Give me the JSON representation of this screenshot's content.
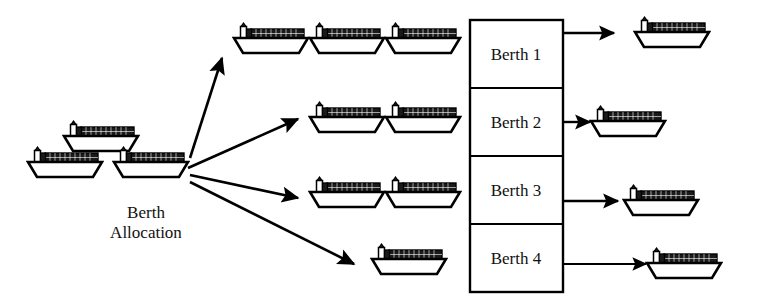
{
  "diagram": {
    "title": "Berth Allocation",
    "process_label_line1": "Berth",
    "process_label_line2": "Allocation",
    "colors": {
      "stroke": "#000000",
      "background": "#ffffff",
      "cargo_fill": "#1a1a1a",
      "hull_fill": "#ffffff"
    },
    "input_ships": [
      {
        "id": "input-ship-1",
        "x": 62,
        "y": 120
      },
      {
        "id": "input-ship-2",
        "x": 26,
        "y": 146
      },
      {
        "id": "input-ship-3",
        "x": 112,
        "y": 146
      }
    ],
    "queue_rows": [
      {
        "id": "queue-row-1",
        "berth": "Berth 1",
        "ships": [
          {
            "id": "queue-ship-1-1",
            "x": 232,
            "y": 22
          },
          {
            "id": "queue-ship-1-2",
            "x": 308,
            "y": 22
          },
          {
            "id": "queue-ship-1-3",
            "x": 384,
            "y": 22
          }
        ]
      },
      {
        "id": "queue-row-2",
        "berth": "Berth 2",
        "ships": [
          {
            "id": "queue-ship-2-1",
            "x": 308,
            "y": 101
          },
          {
            "id": "queue-ship-2-2",
            "x": 384,
            "y": 101
          }
        ]
      },
      {
        "id": "queue-row-3",
        "berth": "Berth 3",
        "ships": [
          {
            "id": "queue-ship-3-1",
            "x": 308,
            "y": 176
          },
          {
            "id": "queue-ship-3-2",
            "x": 384,
            "y": 176
          }
        ]
      },
      {
        "id": "queue-row-4",
        "berth": "Berth 4",
        "ships": [
          {
            "id": "queue-ship-4-1",
            "x": 370,
            "y": 243
          }
        ]
      }
    ],
    "allocation_arrows": [
      {
        "id": "allocation-arrow-1",
        "x1": 190,
        "y1": 158,
        "x2": 224,
        "y2": 57
      },
      {
        "id": "allocation-arrow-2",
        "x1": 188,
        "y1": 168,
        "x2": 300,
        "y2": 118
      },
      {
        "id": "allocation-arrow-3",
        "x1": 190,
        "y1": 175,
        "x2": 300,
        "y2": 199
      },
      {
        "id": "allocation-arrow-4",
        "x1": 190,
        "y1": 182,
        "x2": 356,
        "y2": 265
      }
    ],
    "berth_table": {
      "x": 470,
      "y": 20,
      "width": 93,
      "height": 272,
      "rows": [
        {
          "id": "berth-row-1",
          "label": "Berth 1"
        },
        {
          "id": "berth-row-2",
          "label": "Berth 2"
        },
        {
          "id": "berth-row-3",
          "label": "Berth 3"
        },
        {
          "id": "berth-row-4",
          "label": "Berth 4"
        }
      ]
    },
    "departure_arrows": [
      {
        "id": "departure-arrow-1",
        "x1": 563,
        "y1": 33,
        "x2": 616,
        "y2": 33
      },
      {
        "id": "departure-arrow-2",
        "x1": 563,
        "y1": 122,
        "x2": 592,
        "y2": 122
      },
      {
        "id": "departure-arrow-3",
        "x1": 563,
        "y1": 201,
        "x2": 620,
        "y2": 201
      },
      {
        "id": "departure-arrow-4",
        "x1": 563,
        "y1": 264,
        "x2": 648,
        "y2": 264
      }
    ],
    "departure_ships": [
      {
        "id": "departure-ship-1",
        "x": 633,
        "y": 16
      },
      {
        "id": "departure-ship-2",
        "x": 589,
        "y": 105
      },
      {
        "id": "departure-ship-3",
        "x": 622,
        "y": 184
      },
      {
        "id": "departure-ship-4",
        "x": 645,
        "y": 247
      }
    ]
  }
}
